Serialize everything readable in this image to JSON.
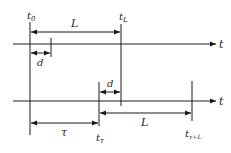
{
  "diagram": {
    "title": "",
    "colors": {
      "line": "#1a1a1a",
      "text": "#222222",
      "background": "#ffffff"
    },
    "axes": [
      {
        "id": "top-axis",
        "label": "t"
      },
      {
        "id": "bottom-axis",
        "label": "t"
      }
    ],
    "markers": {
      "t0": {
        "main": "t",
        "sub": "0"
      },
      "tL": {
        "main": "t",
        "sub": "L"
      },
      "ttau": {
        "main": "t",
        "sub": "τ"
      },
      "ttauL": {
        "main": "t",
        "sub": "τ+L"
      }
    },
    "intervals": {
      "top_L": "L",
      "top_d": "d",
      "bottom_d": "d",
      "bottom_L": "L",
      "tau": "τ"
    }
  }
}
